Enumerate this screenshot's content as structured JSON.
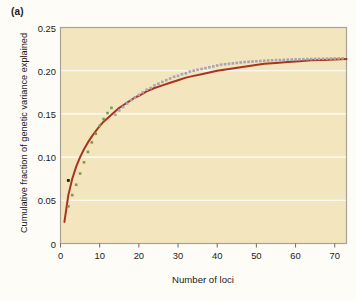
{
  "figure": {
    "panel_label": "(a)",
    "background_color": "#fdfcf7",
    "plot_background_color": "#f3e5be",
    "gridline_color": "#ffffff",
    "frame_color": "#a9a396"
  },
  "chart_data": {
    "type": "line",
    "title": "",
    "subtitle": "",
    "xlabel": "Number of loci",
    "ylabel": "Cumulative fraction of genetic variance explained",
    "xlim": [
      0,
      73
    ],
    "ylim": [
      0,
      0.25
    ],
    "xticks": [
      0,
      10,
      20,
      30,
      40,
      50,
      60,
      70
    ],
    "xticklabels": [
      "0",
      "10",
      "20",
      "30",
      "40",
      "50",
      "60",
      "70"
    ],
    "yticks": [
      0,
      0.05,
      0.1,
      0.15,
      0.2,
      0.25
    ],
    "yticklabels": [
      "0",
      "0.05",
      "0.10",
      "0.15",
      "0.20",
      "0.25"
    ],
    "grid": true,
    "grid_axis": "y",
    "legend": false,
    "legend_position": "none",
    "annotations": [],
    "series": [
      {
        "name": "fitted-curve",
        "style": "line",
        "color": "#a8341f",
        "linewidth": 2.0,
        "x": [
          1,
          2,
          3,
          4,
          5,
          6,
          7,
          8,
          9,
          10,
          11,
          12,
          13,
          14,
          15,
          16,
          17,
          18,
          19,
          20,
          22,
          24,
          26,
          28,
          30,
          32,
          34,
          36,
          38,
          40,
          43,
          46,
          49,
          52,
          55,
          58,
          61,
          64,
          67,
          70,
          73
        ],
        "y": [
          0.025,
          0.056,
          0.075,
          0.089,
          0.1,
          0.109,
          0.117,
          0.124,
          0.13,
          0.136,
          0.141,
          0.145,
          0.149,
          0.153,
          0.157,
          0.16,
          0.163,
          0.166,
          0.169,
          0.171,
          0.176,
          0.18,
          0.183,
          0.186,
          0.189,
          0.192,
          0.194,
          0.196,
          0.198,
          0.2,
          0.202,
          0.204,
          0.206,
          0.208,
          0.209,
          0.21,
          0.211,
          0.212,
          0.2125,
          0.213,
          0.2135
        ]
      },
      {
        "name": "observed-points-low",
        "style": "markers",
        "marker": "square",
        "color": "#7d9a4a",
        "size": 2.6,
        "x": [
          2,
          3,
          4,
          5,
          6,
          7,
          8,
          9,
          10,
          11,
          12,
          13
        ],
        "y": [
          0.043,
          0.056,
          0.068,
          0.081,
          0.094,
          0.106,
          0.117,
          0.127,
          0.136,
          0.144,
          0.151,
          0.157
        ]
      },
      {
        "name": "observed-points-high",
        "style": "markers",
        "marker": "square",
        "color": "#a9a3b4",
        "size": 2.6,
        "x": [
          14,
          15,
          16,
          17,
          18,
          19,
          20,
          21,
          22,
          23,
          24,
          25,
          26,
          27,
          28,
          29,
          30,
          31,
          32,
          33,
          34,
          35,
          36,
          37,
          38,
          39,
          40,
          41,
          42,
          43,
          44,
          45,
          46,
          47,
          48,
          49,
          50,
          51,
          52,
          53,
          54,
          55,
          56,
          57,
          58,
          59,
          60,
          61,
          62,
          63,
          64,
          65,
          66,
          67,
          68,
          69,
          70,
          71,
          72
        ],
        "y": [
          0.149,
          0.154,
          0.158,
          0.162,
          0.166,
          0.169,
          0.172,
          0.175,
          0.178,
          0.18,
          0.183,
          0.185,
          0.187,
          0.189,
          0.191,
          0.193,
          0.194,
          0.196,
          0.197,
          0.199,
          0.2,
          0.201,
          0.202,
          0.203,
          0.204,
          0.205,
          0.206,
          0.207,
          0.2075,
          0.208,
          0.2085,
          0.209,
          0.2095,
          0.21,
          0.2103,
          0.2106,
          0.2109,
          0.2112,
          0.2115,
          0.2118,
          0.212,
          0.2122,
          0.2124,
          0.2126,
          0.2128,
          0.213,
          0.2131,
          0.2132,
          0.2133,
          0.2134,
          0.2135,
          0.2136,
          0.2137,
          0.2138,
          0.2139,
          0.214,
          0.2141,
          0.2142,
          0.2143
        ]
      },
      {
        "name": "single-black-point",
        "style": "markers",
        "marker": "square",
        "color": "#1b1b1b",
        "size": 2.8,
        "x": [
          2
        ],
        "y": [
          0.073
        ]
      }
    ]
  }
}
